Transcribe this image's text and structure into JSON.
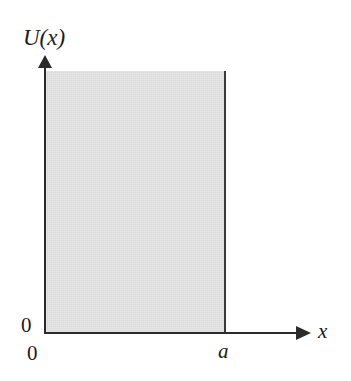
{
  "figure": {
    "type": "potential-energy-diagram",
    "axes": {
      "y_label": "U(x)",
      "x_label": "x",
      "y_origin_label": "0",
      "x_origin_label": "0"
    },
    "marks": {
      "well_right_edge_label": "a"
    },
    "colors": {
      "well_fill": "#e4e4e4",
      "axis": "#2b2b2b",
      "wall": "#3a3a3a",
      "background": "#ffffff",
      "text": "#1c1c1c"
    }
  },
  "chart_data": {
    "type": "area",
    "title": "",
    "xlabel": "x",
    "ylabel": "U(x)",
    "xlim": [
      0,
      1.45
    ],
    "ylim": [
      0,
      1.1
    ],
    "grid": false,
    "legend": null,
    "x_tick_labels": [
      "0",
      "a"
    ],
    "x_tick_values": [
      0,
      1
    ],
    "y_tick_labels": [
      "0"
    ],
    "y_tick_values": [
      0
    ],
    "series": [
      {
        "name": "U(x)",
        "x": [
          0,
          0,
          1,
          1
        ],
        "values": [
          0,
          1,
          1,
          0
        ],
        "fill": true,
        "note": "Shaded region spans x = 0 to x = a, filled from U = 0 upward beyond the top of the plot"
      }
    ],
    "annotations": [
      {
        "text": "U(x)",
        "role": "y-axis-label"
      },
      {
        "text": "x",
        "role": "x-axis-label"
      },
      {
        "text": "a",
        "role": "x-tick-label"
      },
      {
        "text": "0",
        "role": "origin-label-y"
      },
      {
        "text": "0",
        "role": "origin-label-x"
      }
    ]
  }
}
